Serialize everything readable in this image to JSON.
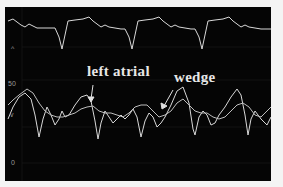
{
  "figure": {
    "background": "#050505",
    "trace_color": "#d8d8d8",
    "grid_color": "#1c1c1c"
  },
  "axis": {
    "labels": [
      {
        "text": "^",
        "y_px": 45
      },
      {
        "text": "50",
        "y_px": 80
      },
      {
        "text": "v",
        "y_px": 113
      },
      {
        "text": "0",
        "y_px": 163
      }
    ]
  },
  "annotations": {
    "left_atrial": {
      "label": "left atrial"
    },
    "wedge": {
      "label": "wedge"
    }
  },
  "traces": [
    {
      "name": "ECG",
      "description": "top electrocardiogram trace with periodic sharp negative deflections"
    },
    {
      "name": "left atrial pressure",
      "description": "waveform with pronounced a/v waves"
    },
    {
      "name": "wedge pressure",
      "description": "damped, delayed waveform"
    }
  ]
}
